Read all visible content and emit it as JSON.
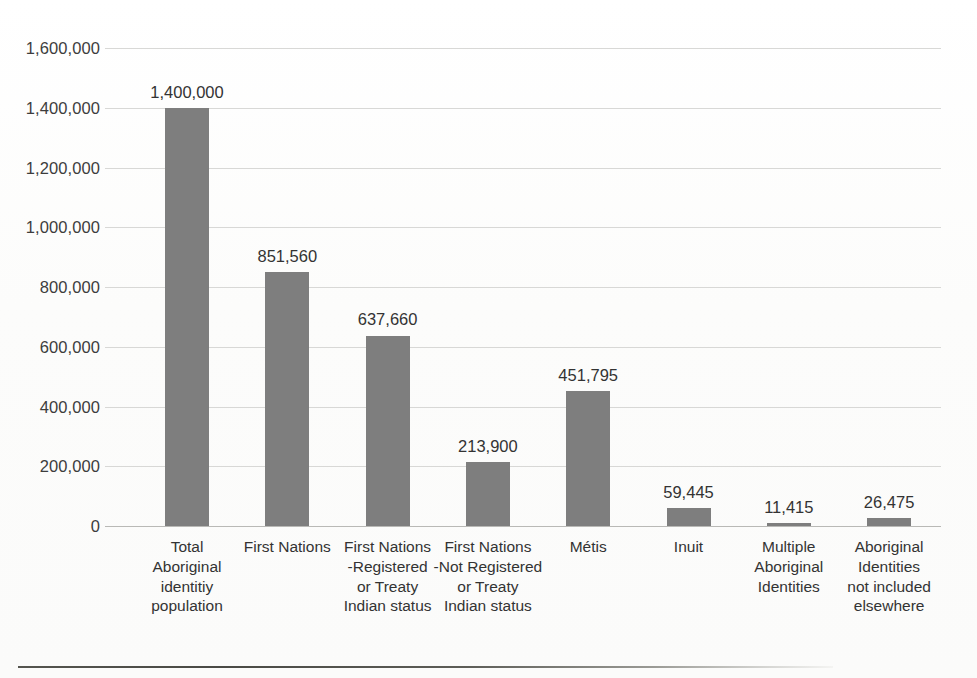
{
  "chart_data": {
    "type": "bar",
    "title": "",
    "subtitle": "",
    "xlabel": "",
    "ylabel": "",
    "ylim": [
      0,
      1600000
    ],
    "ytick_step": 200000,
    "grid": true,
    "legend": "none",
    "orientation": "vertical",
    "bar_color": "#7e7e7e",
    "categories": [
      "Total Aboriginal identitiy population",
      "First Nations",
      "First Nations -Registered or Treaty Indian status",
      "First Nations -Not Registered or Treaty Indian status",
      "Métis",
      "Inuit",
      "Multiple Aboriginal Identities",
      "Aboriginal Identities not included elsewhere"
    ],
    "values": [
      1400000,
      851560,
      637660,
      213900,
      451795,
      59445,
      11415,
      26475
    ],
    "data_labels": [
      "1,400,000",
      "851,560",
      "637,660",
      "213,900",
      "451,795",
      "59,445",
      "11,415",
      "26,475"
    ],
    "ytick_labels": [
      "1,600,000",
      "1,400,000",
      "1,200,000",
      "1,000,000",
      "800,000",
      "600,000",
      "400,000",
      "200,000",
      "0"
    ],
    "ytick_values": [
      1600000,
      1400000,
      1200000,
      1000000,
      800000,
      600000,
      400000,
      200000,
      0
    ],
    "category_lines": [
      [
        "Total",
        "Aboriginal",
        "identitiy",
        "population"
      ],
      [
        "First Nations"
      ],
      [
        "First Nations",
        "-Registered",
        "or Treaty",
        "Indian status"
      ],
      [
        "First Nations",
        "-Not Registered",
        "or Treaty",
        "Indian status"
      ],
      [
        "Métis"
      ],
      [
        "Inuit"
      ],
      [
        "Multiple",
        "Aboriginal",
        "Identities"
      ],
      [
        "Aboriginal",
        "Identities",
        "not included",
        "elsewhere"
      ]
    ]
  },
  "colors": {
    "bar": "#7e7e7e",
    "gridline": "#d8d8d6",
    "axis_text": "#3d3d3d",
    "label_text": "#333333",
    "rule": "#4a4a45",
    "background": "#fdfdfc"
  },
  "figure": {
    "bottom_rule_present": true
  }
}
